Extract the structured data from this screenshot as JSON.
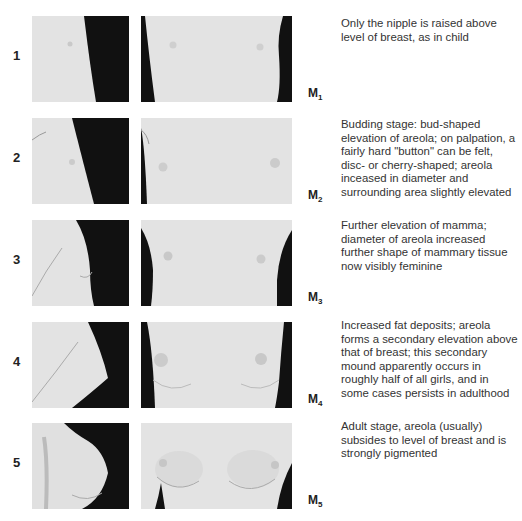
{
  "figure": {
    "stages": [
      {
        "number": "1",
        "label_main": "M",
        "label_sub": "1",
        "description": "Only the nipple is raised above level of breast, as in child",
        "left_photo": "side-view-stage-1",
        "right_photo": "front-view-stage-1"
      },
      {
        "number": "2",
        "label_main": "M",
        "label_sub": "2",
        "description": "Budding stage: bud-shaped elevation of areola; on palpation, a fairly hard \"button\" can be felt, disc- or cherry-shaped; areola inceased in diameter and surrounding area slightly elevated",
        "left_photo": "side-view-stage-2",
        "right_photo": "front-view-stage-2"
      },
      {
        "number": "3",
        "label_main": "M",
        "label_sub": "3",
        "description": "Further elevation of mamma; diameter of areola increased further shape of mammary tissue now visibly feminine",
        "left_photo": "side-view-stage-3",
        "right_photo": "front-view-stage-3"
      },
      {
        "number": "4",
        "label_main": "M",
        "label_sub": "4",
        "description": "Increased fat deposits; areola forms a secondary elevation above that of breast; this secondary mound apparently occurs in roughly half of all girls, and in some cases persists in adulthood",
        "left_photo": "side-view-stage-4",
        "right_photo": "front-view-stage-4"
      },
      {
        "number": "5",
        "label_main": "M",
        "label_sub": "5",
        "description": "Adult stage, areola (usually) subsides to level of breast and is strongly pigmented",
        "left_photo": "side-view-stage-5",
        "right_photo": "front-view-stage-5"
      }
    ]
  },
  "colors": {
    "background": "#ffffff",
    "skin": "#e2e2e2",
    "backdrop": "#111111",
    "text": "#222222"
  }
}
